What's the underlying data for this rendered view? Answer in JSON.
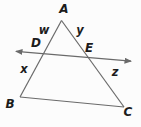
{
  "figure": {
    "labels": {
      "A": "A",
      "B": "B",
      "C": "C",
      "D": "D",
      "E": "E",
      "w": "w",
      "x": "x",
      "y": "y",
      "z": "z"
    },
    "colors": {
      "line": "#6a6a6a",
      "text": "#1c1c1c",
      "background": "#fcfcfc"
    }
  }
}
